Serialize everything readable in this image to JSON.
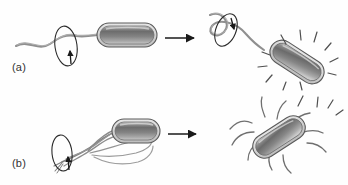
{
  "figure": {
    "background_color": "#fefefe",
    "width": 348,
    "height": 185
  },
  "palette": {
    "cell_outline": "#4a4a4a",
    "cell_rim_light": "#d8d8d8",
    "cell_fill_dark": "#6a6a6a",
    "cell_fill_mid": "#8a8a8a",
    "cell_fill_light": "#c4c4c4",
    "flagellum": "#8f8f8f",
    "flagellum_dark": "#6d6d6d",
    "arrow": "#1a1a1a",
    "motion_line": "#5a5a5a",
    "label_text": "#333333",
    "ghost_text": "#ededed"
  },
  "panels": [
    {
      "id": "a",
      "label": "(a)",
      "flagella_type": "single-polar-flagellum",
      "left_state": {
        "name": "run",
        "cell_orientation": "horizontal",
        "flagellum_form": "smooth-helical-wave",
        "rotation_direction": "counterclockwise",
        "rotation_arrow": "up"
      },
      "transition_arrow": "right-arrow",
      "right_state": {
        "name": "tumble",
        "cell_orientation": "tilted",
        "flagellum_form": "smooth-helical-wave",
        "rotation_direction": "clockwise",
        "rotation_arrow": "down",
        "motion_lines": 9
      }
    },
    {
      "id": "b",
      "label": "(b)",
      "flagella_type": "peritrichous-multiple-flagella",
      "left_state": {
        "name": "run",
        "cell_orientation": "horizontal",
        "flagellum_form": "bundled-rope",
        "rotation_direction": "counterclockwise",
        "rotation_arrow": "up"
      },
      "transition_arrow": "right-arrow",
      "right_state": {
        "name": "tumble",
        "cell_orientation": "tilted",
        "flagellum_form": "splayed-apart",
        "flagella_count": 10,
        "motion_lines": 4
      }
    }
  ],
  "ghost_text": {
    "line_1": "  ",
    "line_2": " ",
    "line_3": "  ",
    "line_4": " "
  }
}
